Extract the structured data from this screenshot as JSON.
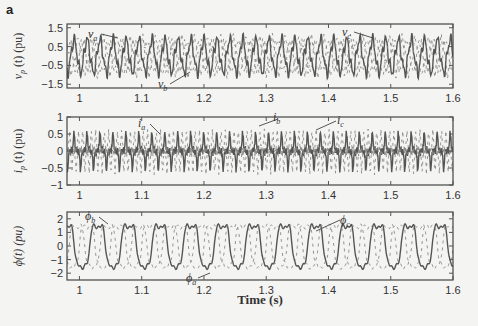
{
  "figure": {
    "panel_label": "a",
    "xlabel": "Time (s)"
  },
  "chart_data": [
    {
      "type": "line",
      "title": "",
      "xlabel": "",
      "ylabel": "v_p (t) (pu)",
      "xlim": [
        0.98,
        1.6
      ],
      "ylim": [
        -1.7,
        1.7
      ],
      "xticks": [
        "1",
        "1.1",
        "1.2",
        "1.3",
        "1.4",
        "1.5",
        "1.6"
      ],
      "yticks": [
        "1.5",
        "0.5",
        "−0.5",
        "−1.5"
      ],
      "annotations": [
        "v_a",
        "v_b",
        "v_c"
      ],
      "series": [
        {
          "name": "v_a",
          "style": "dashed",
          "amplitude": 1.0,
          "phase_deg": 0
        },
        {
          "name": "v_b",
          "style": "solid",
          "amplitude": 1.0,
          "phase_deg": -120
        },
        {
          "name": "v_c",
          "style": "dashed",
          "amplitude": 1.0,
          "phase_deg": 120
        }
      ],
      "grid": false
    },
    {
      "type": "line",
      "title": "",
      "xlabel": "",
      "ylabel": "i_p (t) (pu)",
      "xlim": [
        0.98,
        1.6
      ],
      "ylim": [
        -1,
        1
      ],
      "xticks": [
        "1",
        "1.1",
        "1.2",
        "1.3",
        "1.4",
        "1.5",
        "1.6"
      ],
      "yticks": [
        "1",
        "0.5",
        "0",
        "−0.5",
        "−1"
      ],
      "annotations": [
        "i_a",
        "i_b",
        "i_c"
      ],
      "series": [
        {
          "name": "i_a",
          "style": "dashed",
          "peak_range": [
            -0.7,
            0.8
          ]
        },
        {
          "name": "i_b",
          "style": "solid",
          "peak_range": [
            -0.7,
            0.6
          ]
        },
        {
          "name": "i_c",
          "style": "dashed",
          "peak_range": [
            -0.8,
            0.7
          ]
        }
      ],
      "grid": false
    },
    {
      "type": "line",
      "title": "",
      "xlabel": "Time (s)",
      "ylabel": "ϕ(t) (pu)",
      "xlim": [
        0.98,
        1.6
      ],
      "ylim": [
        -2.5,
        2.5
      ],
      "xticks": [
        "1",
        "1.1",
        "1.2",
        "1.3",
        "1.4",
        "1.5",
        "1.6"
      ],
      "yticks": [
        "2",
        "1",
        "0",
        "−1",
        "−2"
      ],
      "annotations": [
        "ϕ_a",
        "ϕ_b",
        "ϕ_c"
      ],
      "series": [
        {
          "name": "ϕ_a",
          "style": "solid",
          "amplitude": 1.6
        },
        {
          "name": "ϕ_b",
          "style": "dashed",
          "amplitude": 1.6
        },
        {
          "name": "ϕ_c",
          "style": "dashed",
          "amplitude": 1.6
        }
      ],
      "grid": false
    }
  ],
  "panels": [
    {
      "ylabel_main": "v",
      "ylabel_sub": "p",
      "ylabel_rest": "(t) (pu)",
      "labels": [
        {
          "t": "v",
          "s": "a"
        },
        {
          "t": "v",
          "s": "b"
        },
        {
          "t": "v",
          "s": "c"
        }
      ]
    },
    {
      "ylabel_main": "i",
      "ylabel_sub": "p",
      "ylabel_rest": "(t) (pu)",
      "labels": [
        {
          "t": "i",
          "s": "a"
        },
        {
          "t": "i",
          "s": "b"
        },
        {
          "t": "i",
          "s": "c"
        }
      ]
    },
    {
      "ylabel_main": "ϕ(t) (pu)",
      "ylabel_sub": "",
      "ylabel_rest": "",
      "labels": [
        {
          "t": "ϕ",
          "s": "a"
        },
        {
          "t": "ϕ",
          "s": "b"
        },
        {
          "t": "ϕ",
          "s": "c"
        }
      ]
    }
  ]
}
